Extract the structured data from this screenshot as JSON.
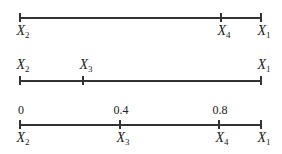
{
  "diagram": {
    "lines": [
      {
        "name": "line-1",
        "y": 17,
        "x_start": 20,
        "x_end": 261,
        "ticks": [
          {
            "x": 20,
            "var": "X",
            "sub": "2",
            "label_pos": "below"
          },
          {
            "x": 221,
            "var": "X",
            "sub": "4",
            "label_pos": "below"
          },
          {
            "x": 261,
            "var": "X",
            "sub": "1",
            "label_pos": "below"
          }
        ]
      },
      {
        "name": "line-2",
        "y": 80,
        "x_start": 20,
        "x_end": 261,
        "ticks": [
          {
            "x": 20,
            "var": "X",
            "sub": "2",
            "label_pos": "above"
          },
          {
            "x": 83,
            "var": "X",
            "sub": "3",
            "label_pos": "above"
          },
          {
            "x": 261,
            "var": "X",
            "sub": "1",
            "label_pos": "above"
          }
        ]
      },
      {
        "name": "line-3",
        "y": 124,
        "x_start": 20,
        "x_end": 261,
        "ticks": [
          {
            "x": 20,
            "var": "X",
            "sub": "2",
            "label_pos": "below",
            "value": "0"
          },
          {
            "x": 120,
            "var": "X",
            "sub": "3",
            "label_pos": "below",
            "value": "0.4"
          },
          {
            "x": 219,
            "var": "X",
            "sub": "4",
            "label_pos": "below",
            "value": "0.8"
          },
          {
            "x": 261,
            "var": "X",
            "sub": "1",
            "label_pos": "below"
          }
        ]
      }
    ]
  }
}
